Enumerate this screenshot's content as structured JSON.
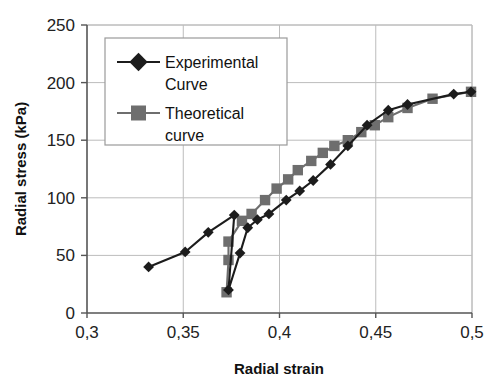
{
  "chart_data": {
    "type": "line",
    "title": "",
    "xlabel": "Radial strain",
    "ylabel": "Radial stress (kPa)",
    "xlim": [
      0.3,
      0.5
    ],
    "ylim": [
      0,
      250
    ],
    "xticks": [
      "0,3",
      "0,35",
      "0,4",
      "0,45",
      "0,5"
    ],
    "xtick_values": [
      0.3,
      0.35,
      0.4,
      0.45,
      0.5
    ],
    "yticks": [
      "0",
      "50",
      "100",
      "150",
      "200",
      "250"
    ],
    "ytick_values": [
      0,
      50,
      100,
      150,
      200,
      250
    ],
    "grid": true,
    "legend_position": "upper left",
    "series": [
      {
        "name": "Experimental Curve",
        "marker": "diamond",
        "color": "#1c1c1c",
        "points": [
          [
            0.332,
            40
          ],
          [
            0.351,
            53
          ],
          [
            0.363,
            70
          ],
          [
            0.3765,
            85
          ],
          [
            0.3735,
            20
          ],
          [
            0.3795,
            52
          ],
          [
            0.3835,
            74
          ],
          [
            0.3885,
            81
          ],
          [
            0.3945,
            86
          ],
          [
            0.4035,
            98
          ],
          [
            0.4105,
            106
          ],
          [
            0.4175,
            115
          ],
          [
            0.4265,
            129
          ],
          [
            0.4355,
            145
          ],
          [
            0.4455,
            163
          ],
          [
            0.4565,
            176
          ],
          [
            0.4665,
            181
          ],
          [
            0.4905,
            190
          ],
          [
            0.4995,
            192
          ]
        ]
      },
      {
        "name": "Theoretical curve",
        "marker": "square",
        "color": "#6e6e6e",
        "points": [
          [
            0.3725,
            18
          ],
          [
            0.3735,
            46
          ],
          [
            0.3735,
            62
          ],
          [
            0.3805,
            80
          ],
          [
            0.3855,
            86
          ],
          [
            0.3925,
            98
          ],
          [
            0.3985,
            108
          ],
          [
            0.4045,
            116
          ],
          [
            0.4095,
            124
          ],
          [
            0.4165,
            132
          ],
          [
            0.4225,
            139
          ],
          [
            0.4285,
            145
          ],
          [
            0.4355,
            150
          ],
          [
            0.4425,
            157
          ],
          [
            0.4495,
            163
          ],
          [
            0.4565,
            170
          ],
          [
            0.4665,
            178
          ],
          [
            0.4795,
            186
          ],
          [
            0.4995,
            192
          ]
        ]
      }
    ],
    "legend": [
      {
        "label_line1": "Experimental",
        "label_line2": "Curve",
        "marker": "diamond",
        "color": "#1c1c1c"
      },
      {
        "label_line1": "Theoretical",
        "label_line2": "curve",
        "marker": "square",
        "color": "#6e6e6e"
      }
    ]
  },
  "colors": {
    "experimental": "#1c1c1c",
    "theoretical": "#6e6e6e",
    "grid": "#bcbcbc",
    "axis": "#555555",
    "background": "#ffffff"
  }
}
